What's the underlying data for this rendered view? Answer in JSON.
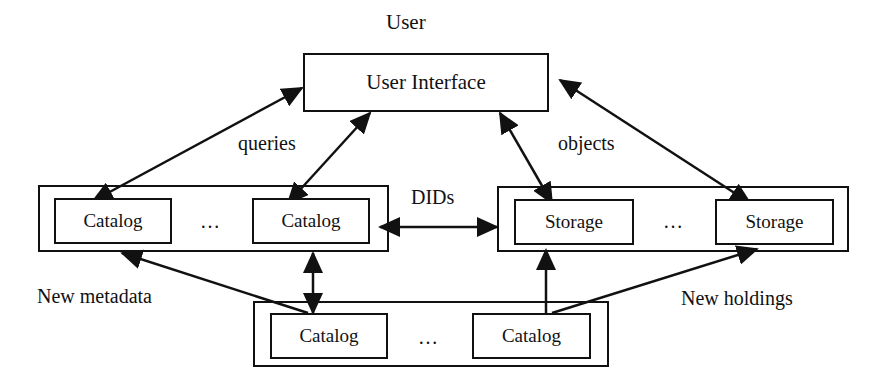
{
  "diagram": {
    "user_label": "User",
    "user_interface": "User Interface",
    "edge_labels": {
      "queries": "queries",
      "objects": "objects",
      "dids": "DIDs",
      "new_metadata": "New metadata",
      "new_holdings": "New holdings"
    },
    "catalog_group_top": {
      "items": [
        "Catalog",
        "Catalog"
      ],
      "ellipsis": "…"
    },
    "storage_group": {
      "items": [
        "Storage",
        "Storage"
      ],
      "ellipsis": "…"
    },
    "catalog_group_bottom": {
      "items": [
        "Catalog",
        "Catalog"
      ],
      "ellipsis": "…"
    }
  }
}
